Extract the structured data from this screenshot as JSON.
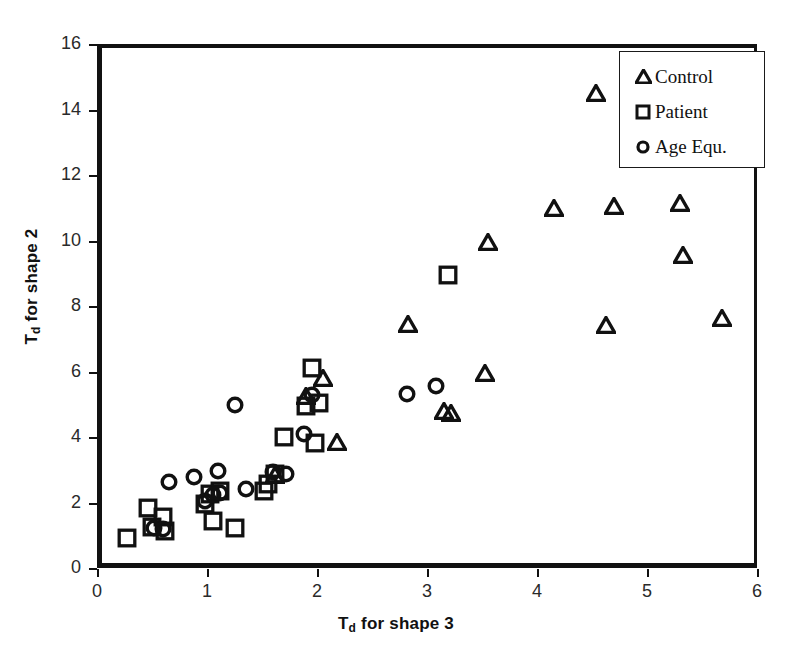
{
  "chart_data": {
    "type": "scatter",
    "title": "",
    "xlabel": "Td for shape 3",
    "ylabel": "Td for shape 2",
    "xlim": [
      0,
      6
    ],
    "ylim": [
      0,
      16
    ],
    "xticks": [
      0,
      1,
      2,
      3,
      4,
      5,
      6
    ],
    "yticks": [
      0,
      2,
      4,
      6,
      8,
      10,
      12,
      14,
      16
    ],
    "grid": false,
    "legend_position": "top-right",
    "series": [
      {
        "name": "Control",
        "marker": "triangle",
        "points": [
          [
            1.62,
            2.85
          ],
          [
            1.9,
            5.25
          ],
          [
            2.05,
            5.8
          ],
          [
            2.18,
            3.85
          ],
          [
            2.83,
            7.45
          ],
          [
            3.15,
            4.8
          ],
          [
            3.22,
            4.72
          ],
          [
            3.53,
            5.95
          ],
          [
            3.55,
            9.95
          ],
          [
            4.15,
            11.0
          ],
          [
            4.54,
            14.5
          ],
          [
            4.63,
            7.42
          ],
          [
            4.7,
            11.05
          ],
          [
            5.3,
            11.15
          ],
          [
            5.33,
            9.55
          ],
          [
            5.68,
            7.62
          ]
        ]
      },
      {
        "name": "Patient",
        "marker": "square",
        "points": [
          [
            0.27,
            0.92
          ],
          [
            0.46,
            1.82
          ],
          [
            0.5,
            1.25
          ],
          [
            0.6,
            1.55
          ],
          [
            0.62,
            1.12
          ],
          [
            0.98,
            1.95
          ],
          [
            1.03,
            2.25
          ],
          [
            1.05,
            1.42
          ],
          [
            1.12,
            2.35
          ],
          [
            1.25,
            1.22
          ],
          [
            1.52,
            2.35
          ],
          [
            1.55,
            2.55
          ],
          [
            1.62,
            2.88
          ],
          [
            1.7,
            4.0
          ],
          [
            1.9,
            4.95
          ],
          [
            1.95,
            6.12
          ],
          [
            1.98,
            3.82
          ],
          [
            2.02,
            5.05
          ],
          [
            3.19,
            8.95
          ]
        ]
      },
      {
        "name": "Age Equ.",
        "marker": "circle",
        "points": [
          [
            0.52,
            1.22
          ],
          [
            0.6,
            1.2
          ],
          [
            0.65,
            2.62
          ],
          [
            0.88,
            2.78
          ],
          [
            0.98,
            2.05
          ],
          [
            1.05,
            2.22
          ],
          [
            1.1,
            2.95
          ],
          [
            1.12,
            2.3
          ],
          [
            1.25,
            4.98
          ],
          [
            1.35,
            2.4
          ],
          [
            1.6,
            2.92
          ],
          [
            1.72,
            2.88
          ],
          [
            1.88,
            4.1
          ],
          [
            1.95,
            5.28
          ],
          [
            2.82,
            5.3
          ],
          [
            3.08,
            5.55
          ]
        ]
      }
    ]
  },
  "legend": {
    "entries": [
      {
        "label": "Control",
        "marker": "triangle-icon"
      },
      {
        "label": "Patient",
        "marker": "square-icon"
      },
      {
        "label": "Age Equ.",
        "marker": "circle-icon"
      }
    ]
  },
  "axes": {
    "x_title_main": "T",
    "x_title_sub": "d",
    "x_title_rest": " for shape 3",
    "y_title_main": "T",
    "y_title_sub": "d",
    "y_title_rest": " for shape 2"
  },
  "colors": {
    "marker": "#111111",
    "frame": "#111111",
    "background": "#ffffff",
    "tick_label": "#2a2a2a"
  }
}
